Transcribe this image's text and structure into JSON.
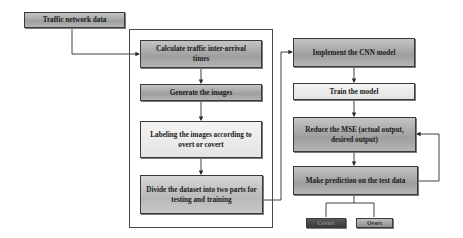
{
  "diagram": {
    "input": {
      "label": "Traffic network data"
    },
    "preprocessing": {
      "steps": [
        {
          "label": "Calculate traffic inter-arrival times"
        },
        {
          "label": "Generate the images"
        },
        {
          "label": "Labeling the images according to overt or covert"
        },
        {
          "label": "Divide the dataset into two parts for testing and training"
        }
      ]
    },
    "model": {
      "steps": [
        {
          "label": "Implement the CNN model"
        },
        {
          "label": "Train the model"
        },
        {
          "label": "Reduce the MSE (actual output, desired output)"
        },
        {
          "label": "Make prediction on the test data"
        }
      ]
    },
    "outputs": [
      {
        "label": "Covert",
        "color": "#4a4a4a"
      },
      {
        "label": "Overt",
        "color": "#a8a8a8"
      }
    ],
    "colors": {
      "line": "#2a2a2a",
      "box_border": "#3a3a3a"
    }
  }
}
